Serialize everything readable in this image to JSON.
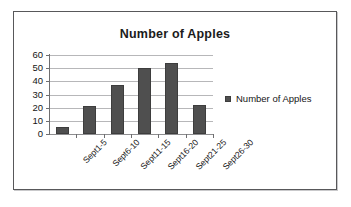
{
  "chart_data": {
    "type": "bar",
    "title": "Number of Apples",
    "xlabel": "",
    "ylabel": "",
    "categories": [
      "Sept1-5",
      "Sept6-10",
      "Sept11-15",
      "Sept16-20",
      "Sept21-25",
      "Sept26-30"
    ],
    "series": [
      {
        "name": "Number of Apples",
        "values": [
          5,
          21,
          37,
          50,
          54,
          22
        ],
        "color": "#4f4f4f"
      }
    ],
    "values": [
      5,
      21,
      37,
      50,
      54,
      22
    ],
    "ylim": [
      0,
      60
    ],
    "ytick_step": 10,
    "yticks": [
      0,
      10,
      20,
      30,
      40,
      50,
      60
    ],
    "ytick_labels": [
      "0",
      "10",
      "20",
      "30",
      "40",
      "50",
      "60"
    ],
    "grid": true,
    "grid_axis": "y",
    "legend": {
      "position": "right",
      "entries": [
        {
          "label": "Number of Apples",
          "color": "#4f4f4f"
        }
      ]
    },
    "xtick_label_rotation": -45,
    "background_color": "#ffffff",
    "border_color": "#58585a"
  }
}
